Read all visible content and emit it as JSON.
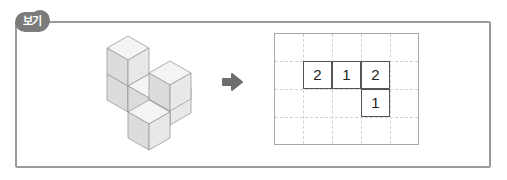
{
  "badge": {
    "label": "보기"
  },
  "figure": {
    "cube_color_top": "#f2f2f2",
    "cube_color_left": "#dcdcdc",
    "cube_color_right": "#e8e8e8",
    "edge_color": "#9a9a9a"
  },
  "arrow": {
    "icon": "right-arrow-icon",
    "color": "#6e6e6e"
  },
  "grid": {
    "columns": 5,
    "rows": 4,
    "cells": [
      {
        "row": 1,
        "col": 1,
        "value": "2"
      },
      {
        "row": 1,
        "col": 2,
        "value": "1"
      },
      {
        "row": 1,
        "col": 3,
        "value": "2"
      },
      {
        "row": 2,
        "col": 3,
        "value": "1"
      }
    ]
  }
}
